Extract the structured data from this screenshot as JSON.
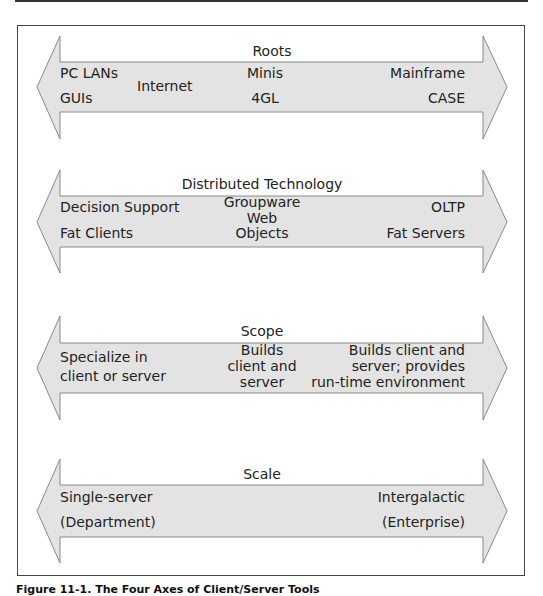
{
  "figure": {
    "caption": "Figure 11-1. The Four Axes of Client/Server Tools",
    "colors": {
      "arrow_fill": "#e3e3e3",
      "arrow_stroke": "#8a8a8a",
      "text": "#222222",
      "frame": "#444444"
    }
  },
  "axes": [
    {
      "title": "Roots",
      "left": [
        "PC LANs",
        "GUIs"
      ],
      "middle_left": [
        "Internet"
      ],
      "middle": [
        "Minis",
        "4GL"
      ],
      "right": [
        "Mainframe",
        "CASE"
      ]
    },
    {
      "title": "Distributed Technology",
      "left": [
        "Decision Support",
        "Fat Clients"
      ],
      "middle": [
        "Groupware",
        "Web",
        "Objects"
      ],
      "right": [
        "OLTP",
        "Fat Servers"
      ]
    },
    {
      "title": "Scope",
      "left": [
        "Specialize in",
        "client or server"
      ],
      "middle": [
        "Builds",
        "client and",
        "server"
      ],
      "right": [
        "Builds client and",
        "server; provides",
        "run-time environment"
      ]
    },
    {
      "title": "Scale",
      "left": [
        "Single-server",
        "(Department)"
      ],
      "right": [
        "Intergalactic",
        "(Enterprise)"
      ]
    }
  ]
}
